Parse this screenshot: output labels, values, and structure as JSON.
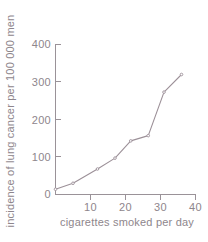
{
  "chart_data": {
    "type": "line",
    "title": "",
    "xlabel": "cigarettes smoked per day",
    "ylabel": "incidence of lung cancer per 100 000 men",
    "xlim": [
      0,
      40
    ],
    "ylim": [
      0,
      400
    ],
    "xticks": [
      10,
      20,
      30,
      40
    ],
    "yticks": [
      0,
      100,
      200,
      300,
      400
    ],
    "xtick_labels": [
      "10",
      "20",
      "30",
      "40"
    ],
    "ytick_labels": [
      "0",
      "100",
      "200",
      "300",
      "400"
    ],
    "grid": false,
    "legend": "none",
    "markers": true,
    "series": [
      {
        "name": "lung cancer incidence",
        "color": "#9c9098",
        "points": [
          {
            "x": 0,
            "y": 14
          },
          {
            "x": 5,
            "y": 30
          },
          {
            "x": 12,
            "y": 68
          },
          {
            "x": 17,
            "y": 97
          },
          {
            "x": 21.5,
            "y": 143
          },
          {
            "x": 26.5,
            "y": 157
          },
          {
            "x": 31,
            "y": 273
          },
          {
            "x": 36,
            "y": 320
          }
        ]
      }
    ]
  },
  "axes": {
    "x_title": "cigarettes smoked per day",
    "y_title": "incidence of lung cancer per 100 000 men"
  }
}
